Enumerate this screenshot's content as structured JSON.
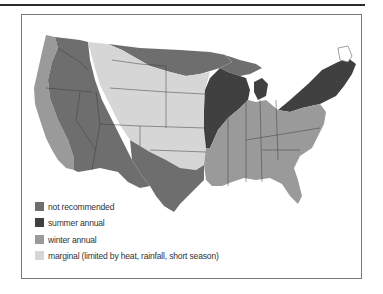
{
  "map": {
    "title": "",
    "colors": {
      "not_recommended": "#6e6e6e",
      "summer_annual": "#404040",
      "winter_annual": "#9a9a9a",
      "marginal": "#d6d6d6",
      "state_lines": "#3c3c3c"
    }
  },
  "legend": {
    "items": [
      {
        "key": "not_recommended",
        "label": "not recommended",
        "color": "#6e6e6e"
      },
      {
        "key": "summer_annual",
        "label": "summer annual",
        "color": "#404040"
      },
      {
        "key": "winter_annual",
        "label": "winter annual",
        "color": "#9a9a9a"
      },
      {
        "key": "marginal",
        "label": "marginal (limited by heat, rainfall, short season)",
        "color": "#d6d6d6"
      }
    ]
  }
}
